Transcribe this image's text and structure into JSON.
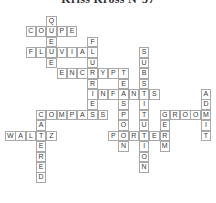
{
  "title": "Kriss Kross N°37",
  "grid": {
    "origin_x": 5,
    "origin_y": 16,
    "cell_w": 10.3,
    "cell_h": 10.43,
    "border_color": "#a8a8a8",
    "letter_color": "#3a3a3a"
  },
  "words": [
    {
      "answer": "QUEUE",
      "direction": "down",
      "row": 0,
      "col": 4
    },
    {
      "answer": "COUPE",
      "direction": "across",
      "row": 1,
      "col": 2
    },
    {
      "answer": "FLUVIAL",
      "direction": "across",
      "row": 3,
      "col": 2
    },
    {
      "answer": "FLURRIES",
      "direction": "down",
      "row": 2,
      "col": 8
    },
    {
      "answer": "ENCRYPT",
      "direction": "across",
      "row": 5,
      "col": 5
    },
    {
      "answer": "TEASPOON",
      "direction": "down",
      "row": 5,
      "col": 11
    },
    {
      "answer": "INFANTS",
      "direction": "across",
      "row": 7,
      "col": 8
    },
    {
      "answer": "SUBSTITUTION",
      "direction": "down",
      "row": 3,
      "col": 13
    },
    {
      "answer": "COMPASS",
      "direction": "across",
      "row": 9,
      "col": 3
    },
    {
      "answer": "CATERED",
      "direction": "down",
      "row": 9,
      "col": 3
    },
    {
      "answer": "WALTZ",
      "direction": "across",
      "row": 11,
      "col": 0
    },
    {
      "answer": "PORTER",
      "direction": "across",
      "row": 11,
      "col": 10
    },
    {
      "answer": "GROOM",
      "direction": "across",
      "row": 9,
      "col": 15
    },
    {
      "answer": "GERM",
      "direction": "down",
      "row": 9,
      "col": 15
    },
    {
      "answer": "ADMIT",
      "direction": "down",
      "row": 7,
      "col": 19
    }
  ],
  "cells": []
}
